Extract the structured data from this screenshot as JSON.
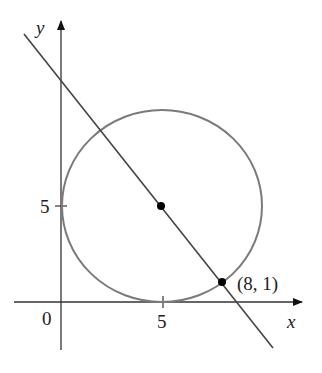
{
  "figure": {
    "axes": {
      "x_label": "x",
      "y_label": "y",
      "origin_label": "0",
      "x_tick_label": "5",
      "y_tick_label": "5"
    },
    "circle": {
      "center": [
        5,
        5
      ],
      "radius": 5,
      "color": "#777777"
    },
    "line": {
      "color": "#444444",
      "passes_through": [
        [
          5,
          5
        ],
        [
          8,
          1
        ]
      ]
    },
    "points": [
      {
        "name": "center",
        "coords": [
          5,
          5
        ],
        "label": ""
      },
      {
        "name": "tangent-point",
        "coords": [
          8,
          1
        ],
        "label": "(8, 1)"
      }
    ]
  }
}
